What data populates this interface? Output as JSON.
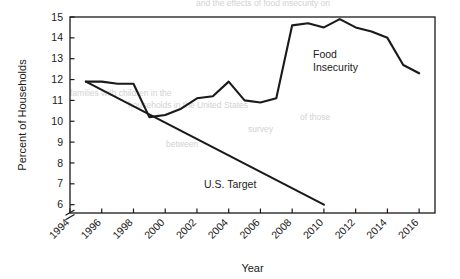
{
  "chart_data": {
    "type": "line",
    "title": "",
    "xlabel": "Year",
    "ylabel": "Percent of Households",
    "xlim": [
      1994,
      2017
    ],
    "ylim": [
      5.6,
      15
    ],
    "yaxis_break": true,
    "grid": false,
    "legend_position": "in-plot annotations",
    "xticks": [
      1994,
      1996,
      1998,
      2000,
      2002,
      2004,
      2006,
      2008,
      2010,
      2012,
      2014,
      2016
    ],
    "xtick_labels": [
      "1994",
      "1996",
      "1998",
      "2000",
      "2002",
      "2004",
      "2006",
      "2008",
      "2010",
      "2012",
      "2014",
      "2016"
    ],
    "xtick_rotation_deg": 45,
    "yticks": [
      6,
      7,
      8,
      9,
      10,
      11,
      12,
      13,
      14,
      15
    ],
    "ytick_labels": [
      "6",
      "7",
      "8",
      "9",
      "10",
      "11",
      "12",
      "13",
      "14",
      "15"
    ],
    "line_color": "#1a1a1a",
    "series": [
      {
        "name": "Food Insecurity",
        "annotation": "Food\nInsecurity",
        "annotation_line1": "Food",
        "annotation_line2": "Insecurity",
        "x": [
          1995,
          1996,
          1997,
          1998,
          1999,
          2000,
          2001,
          2002,
          2003,
          2004,
          2005,
          2006,
          2007,
          2008,
          2009,
          2010,
          2011,
          2012,
          2013,
          2014,
          2015,
          2016
        ],
        "values": [
          11.9,
          11.9,
          11.8,
          11.8,
          10.2,
          10.3,
          10.6,
          11.1,
          11.2,
          11.9,
          11.0,
          10.9,
          11.1,
          14.6,
          14.7,
          14.5,
          14.9,
          14.5,
          14.3,
          14.0,
          12.7,
          12.3
        ]
      },
      {
        "name": "U.S. Target",
        "annotation": "U.S. Target",
        "x": [
          1995,
          2010
        ],
        "values": [
          11.9,
          6.0
        ]
      }
    ]
  },
  "background_bleed": [
    {
      "text": "and the effects of food insecurity on",
      "x": 196,
      "y": 6
    },
    {
      "text": "families with children in the",
      "x": 70,
      "y": 96
    },
    {
      "text": "households in the United States",
      "x": 128,
      "y": 108
    },
    {
      "text": "of those",
      "x": 300,
      "y": 120
    },
    {
      "text": "survey",
      "x": 248,
      "y": 132
    },
    {
      "text": "between",
      "x": 166,
      "y": 147
    }
  ]
}
